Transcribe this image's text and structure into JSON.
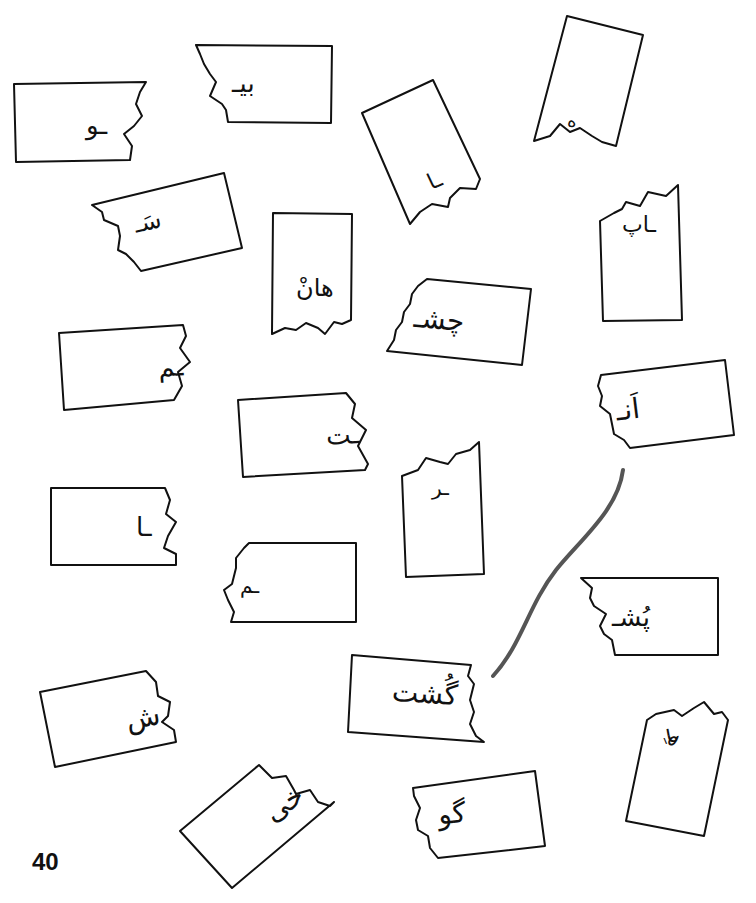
{
  "page": {
    "number": "40",
    "connector_color": "#555555",
    "outline_color": "#111111"
  },
  "fragments": [
    {
      "id": "f1",
      "text": "ـو"
    },
    {
      "id": "f2",
      "text": "بیـ"
    },
    {
      "id": "f3",
      "text": "ه"
    },
    {
      "id": "f4",
      "text": "ـا"
    },
    {
      "id": "f5",
      "text": "سَـ"
    },
    {
      "id": "f6",
      "text": "هانْ"
    },
    {
      "id": "f7",
      "text": "چشـ"
    },
    {
      "id": "f8",
      "text": "ـاپ"
    },
    {
      "id": "f9",
      "text": "ـم"
    },
    {
      "id": "f10",
      "text": "ـت"
    },
    {
      "id": "f11",
      "text": "اَنـ"
    },
    {
      "id": "f12",
      "text": "ـر"
    },
    {
      "id": "f13",
      "text": "ـا"
    },
    {
      "id": "f14",
      "text": "ـم"
    },
    {
      "id": "f15",
      "text": "پُشـ"
    },
    {
      "id": "f16",
      "text": "ش"
    },
    {
      "id": "f17",
      "text": "گُشت"
    },
    {
      "id": "f18",
      "text": "خی"
    },
    {
      "id": "f19",
      "text": "گو"
    },
    {
      "id": "f20",
      "text": "هِـ"
    }
  ],
  "connections": [
    {
      "from": "اَنـ",
      "to": "گُشت"
    }
  ]
}
